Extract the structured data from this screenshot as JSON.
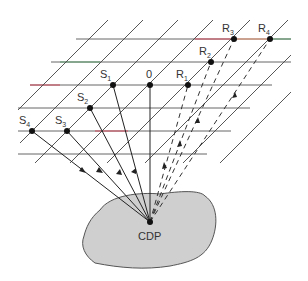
{
  "figure": {
    "type": "CDP ray-path diagram",
    "labels": {
      "sources": [
        {
          "id": "S1",
          "base": "S",
          "sub": "1",
          "x": 113,
          "y": 85
        },
        {
          "id": "S2",
          "base": "S",
          "sub": "2",
          "x": 90,
          "y": 108
        },
        {
          "id": "S3",
          "base": "S",
          "sub": "3",
          "x": 67,
          "y": 131
        },
        {
          "id": "S4",
          "base": "S",
          "sub": "4",
          "x": 32,
          "y": 131
        }
      ],
      "center": {
        "id": "0",
        "text": "0",
        "x": 150,
        "y": 85
      },
      "receivers": [
        {
          "id": "R1",
          "base": "R",
          "sub": "1",
          "x": 188,
          "y": 85
        },
        {
          "id": "R2",
          "base": "R",
          "sub": "2",
          "x": 211,
          "y": 62
        },
        {
          "id": "R3",
          "base": "R",
          "sub": "3",
          "x": 234,
          "y": 39
        },
        {
          "id": "R4",
          "base": "R",
          "sub": "4",
          "x": 270,
          "y": 39
        }
      ],
      "cdp": {
        "text": "CDP",
        "x": 150,
        "y": 222
      }
    },
    "colors": {
      "line": "#3a3a3a",
      "reflector_fill": "#cfcfcf",
      "reflector_stroke": "#555555",
      "accent_red": "#d0485a",
      "accent_green": "#5a9a6a"
    }
  }
}
